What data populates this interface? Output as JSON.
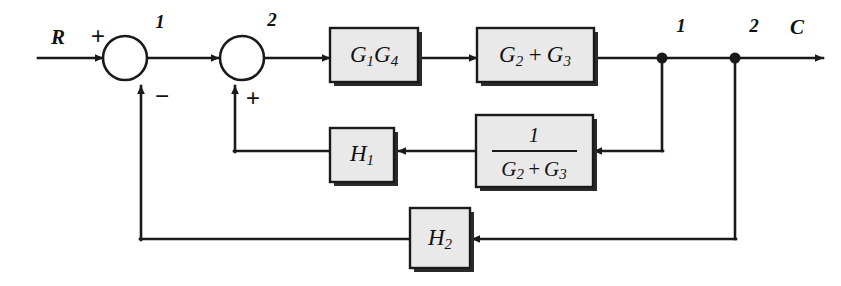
{
  "diagram": {
    "input_label": "R",
    "output_label": "C",
    "colors": {
      "block_fill": "#e9e9e9",
      "stroke": "#1a1a1a",
      "background": "#ffffff"
    },
    "summing_junctions": [
      {
        "id": "junction-1",
        "label": "1",
        "input_sign": "+",
        "feedback_sign": "−"
      },
      {
        "id": "junction-2",
        "label": "2",
        "input_sign": "+",
        "feedback_sign": "+"
      }
    ],
    "takeoff_nodes": [
      {
        "id": "node-1",
        "label": "1"
      },
      {
        "id": "node-2",
        "label": "2"
      }
    ],
    "blocks": [
      {
        "id": "block-g1g4",
        "kind": "product",
        "main": "G",
        "sub": "1",
        "main2": "G",
        "sub2": "4",
        "text": "G1G4"
      },
      {
        "id": "block-g2-plus-g3",
        "kind": "sum",
        "main": "G",
        "sub": "2",
        "operator": "+",
        "main2": "G",
        "sub2": "3",
        "text": "G2 + G3"
      },
      {
        "id": "block-h1",
        "kind": "gain",
        "main": "H",
        "sub": "1",
        "text": "H1"
      },
      {
        "id": "block-inverse-g2-plus-g3",
        "kind": "fraction",
        "numerator": "1",
        "denominator_main": "G",
        "denominator_sub": "2",
        "denominator_operator": "+",
        "denominator_main2": "G",
        "denominator_sub2": "3",
        "text": "1 / (G2 + G3)"
      },
      {
        "id": "block-h2",
        "kind": "gain",
        "main": "H",
        "sub": "2",
        "text": "H2"
      }
    ]
  }
}
